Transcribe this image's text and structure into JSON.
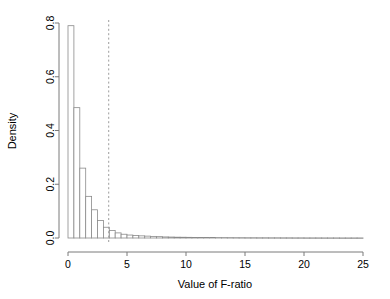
{
  "chart_data": {
    "type": "bar",
    "title": "",
    "subtitle": "",
    "xlabel": "Value of F-ratio",
    "ylabel": "Density",
    "xlim": [
      0,
      25
    ],
    "ylim": [
      0.0,
      0.8
    ],
    "xticks": [
      "0",
      "5",
      "10",
      "15",
      "20",
      "25"
    ],
    "xtick_values": [
      0,
      5,
      10,
      15,
      20,
      25
    ],
    "yticks": [
      "0.0",
      "0.2",
      "0.4",
      "0.6",
      "0.8"
    ],
    "ytick_values": [
      0.0,
      0.2,
      0.4,
      0.6,
      0.8
    ],
    "grid": false,
    "legend": null,
    "bin_width": 0.5,
    "bin_edges": [
      0,
      0.5,
      1,
      1.5,
      2,
      2.5,
      3,
      3.5,
      4,
      4.5,
      5,
      5.5,
      6,
      6.5,
      7,
      7.5,
      8,
      8.5,
      9,
      9.5,
      10,
      10.5,
      11,
      11.5,
      12,
      12.5,
      13,
      13.5,
      14,
      14.5,
      15,
      15.5,
      16,
      16.5,
      17,
      17.5,
      18,
      18.5,
      19,
      19.5,
      20,
      20.5,
      21,
      21.5,
      22,
      22.5,
      23,
      23.5,
      24,
      24.5,
      25
    ],
    "categories": [
      "0-0.5",
      "0.5-1",
      "1-1.5",
      "1.5-2",
      "2-2.5",
      "2.5-3",
      "3-3.5",
      "3.5-4",
      "4-4.5",
      "4.5-5",
      "5-5.5",
      "5.5-6",
      "6-6.5",
      "6.5-7",
      "7-7.5",
      "7.5-8",
      "8-8.5",
      "8.5-9",
      "9-9.5",
      "9.5-10",
      "10-10.5",
      "10.5-11",
      "11-11.5",
      "11.5-12",
      "12-12.5",
      "12.5-13",
      "13-13.5",
      "13.5-14",
      "14-14.5",
      "14.5-15",
      "15-15.5",
      "15.5-16",
      "16-16.5",
      "16.5-17",
      "17-17.5",
      "17.5-18",
      "18-18.5",
      "18.5-19",
      "19-19.5",
      "19.5-20",
      "20-20.5",
      "20.5-21",
      "21-21.5",
      "21.5-22",
      "22-22.5",
      "22.5-23",
      "23-23.5",
      "23.5-24",
      "24-24.5",
      "24.5-25"
    ],
    "values": [
      0.79,
      0.485,
      0.26,
      0.155,
      0.105,
      0.065,
      0.04,
      0.028,
      0.019,
      0.014,
      0.011,
      0.009,
      0.008,
      0.007,
      0.006,
      0.005,
      0.004,
      0.0035,
      0.003,
      0.0028,
      0.0025,
      0.0022,
      0.002,
      0.0018,
      0.0016,
      0.0015,
      0.0014,
      0.0013,
      0.0012,
      0.0011,
      0.001,
      0.001,
      0.0009,
      0.0009,
      0.0008,
      0.0008,
      0.0007,
      0.0007,
      0.0006,
      0.0006,
      0.0005,
      0.0005,
      0.0005,
      0.0004,
      0.0004,
      0.0004,
      0.0003,
      0.0003,
      0.0003,
      0.0003
    ],
    "annotations": [
      {
        "name": "critical-value-line",
        "type": "vline",
        "x": 3.45,
        "style": "dashed",
        "label": ""
      }
    ],
    "bar_fill": "#ffffff",
    "bar_stroke": "#8a8a8a",
    "axis_color": "#7a7a7a",
    "text_color": "#000000",
    "vline_color": "#9c9c9c"
  }
}
